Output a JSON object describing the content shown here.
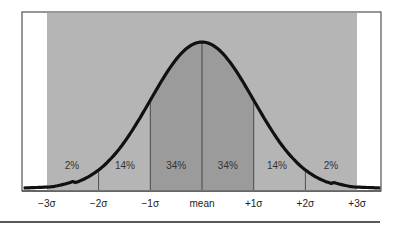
{
  "chart_data": {
    "type": "area",
    "title": "",
    "xlabel": "",
    "ylabel": "",
    "x_ticks": [
      "-3σ",
      "-2σ",
      "-1σ",
      "mean",
      "+1σ",
      "+2σ",
      "+3σ"
    ],
    "x_values": [
      -3,
      -2,
      -1,
      0,
      1,
      2,
      3
    ],
    "xlim": [
      -3.5,
      3.5
    ],
    "bands": [
      {
        "from": -3,
        "to": -2,
        "label": "2%",
        "value": 2,
        "shade": "light"
      },
      {
        "from": -2,
        "to": -1,
        "label": "14%",
        "value": 14,
        "shade": "light"
      },
      {
        "from": -1,
        "to": 0,
        "label": "34%",
        "value": 34,
        "shade": "dark"
      },
      {
        "from": 0,
        "to": 1,
        "label": "34%",
        "value": 34,
        "shade": "dark"
      },
      {
        "from": 1,
        "to": 2,
        "label": "14%",
        "value": 14,
        "shade": "light"
      },
      {
        "from": 2,
        "to": 3,
        "label": "2%",
        "value": 2,
        "shade": "light"
      }
    ],
    "grid": false,
    "legend": null
  },
  "colors": {
    "light_band": "#b5b5b5",
    "dark_band": "#9b9b9b",
    "curve": "#111111",
    "frame": "#333333",
    "background": "#ffffff"
  }
}
